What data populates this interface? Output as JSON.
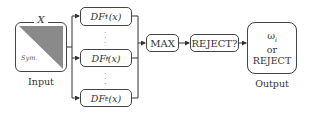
{
  "diagram": {
    "input": {
      "matrix_label": "X",
      "lower_label": "Sym.",
      "caption": "Input",
      "fill_color": "#8a8a8a"
    },
    "discriminant_functions": [
      {
        "name": "DF",
        "sub": "1",
        "sup": "*",
        "arg": "(x)"
      },
      {
        "name": "DF",
        "sub": "i",
        "sup": "*",
        "arg": "(x)"
      },
      {
        "name": "DF",
        "sub": "c",
        "sup": "*",
        "arg": "(x)"
      }
    ],
    "ellipsis": "⋮",
    "max_label": "MAX",
    "reject_label": "REJECT?",
    "output": {
      "line1": "ω",
      "line1_sub": "i",
      "line2": "or",
      "line3": "REJECT",
      "caption": "Output"
    }
  }
}
